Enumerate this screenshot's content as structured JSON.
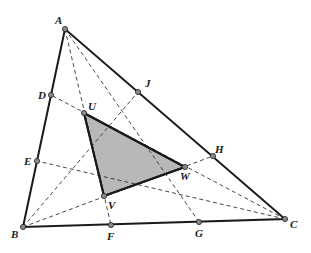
{
  "diagram": {
    "type": "triangle-cevians",
    "colors": {
      "line": "#1a1a1a",
      "dashed": "#333333",
      "fill": "#b8b8b8",
      "point": "#8a8a8a"
    },
    "points": {
      "A": {
        "label": "A",
        "x": 65,
        "y": 29
      },
      "B": {
        "label": "B",
        "x": 23,
        "y": 227
      },
      "C": {
        "label": "C",
        "x": 285,
        "y": 219
      },
      "D": {
        "label": "D",
        "x": 51,
        "y": 95
      },
      "E": {
        "label": "E",
        "x": 37,
        "y": 161
      },
      "F": {
        "label": "F",
        "x": 111,
        "y": 225
      },
      "G": {
        "label": "G",
        "x": 199,
        "y": 222
      },
      "H": {
        "label": "H",
        "x": 213,
        "y": 156
      },
      "J": {
        "label": "J",
        "x": 138,
        "y": 92
      },
      "U": {
        "label": "U",
        "x": 84,
        "y": 113
      },
      "V": {
        "label": "V",
        "x": 104,
        "y": 196
      },
      "W": {
        "label": "W",
        "x": 185,
        "y": 167
      }
    },
    "outer_triangle": [
      "A",
      "B",
      "C"
    ],
    "inner_triangle": [
      "U",
      "V",
      "W"
    ],
    "dashed_segments": [
      [
        "A",
        "F"
      ],
      [
        "A",
        "G"
      ],
      [
        "B",
        "H"
      ],
      [
        "B",
        "J"
      ],
      [
        "C",
        "D"
      ],
      [
        "C",
        "E"
      ]
    ]
  }
}
